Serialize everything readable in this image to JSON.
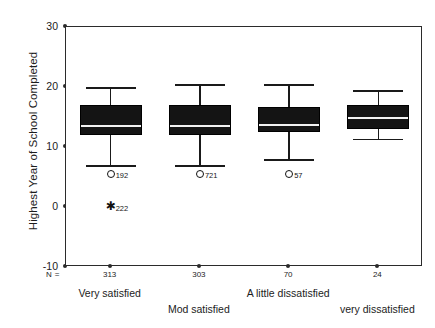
{
  "chart_data": {
    "type": "boxplot",
    "title": "",
    "xlabel": "",
    "ylabel": "Highest Year of School Completed",
    "ylim": [
      -10,
      30
    ],
    "yticks": [
      30,
      20,
      10,
      0,
      -10
    ],
    "grid": false,
    "legend": "none",
    "n_prefix": "N =",
    "categories": [
      "Very satisfied",
      "Mod satisfied",
      "A little dissatisfied",
      "very dissatisfied"
    ],
    "counts": [
      "313",
      "303",
      "70",
      "24"
    ],
    "boxes": [
      {
        "category": "Very satisfied",
        "n": "313",
        "whisker_low": 7.0,
        "q1": 12.0,
        "median": 13.6,
        "q3": 17.0,
        "whisker_high": 20.0,
        "outliers": [
          {
            "value": 5.5,
            "marker": "circle",
            "label": "192"
          },
          {
            "value": 0.0,
            "marker": "star",
            "label": "222"
          }
        ]
      },
      {
        "category": "Mod satisfied",
        "n": "303",
        "whisker_low": 7.0,
        "q1": 12.0,
        "median": 13.6,
        "q3": 17.0,
        "whisker_high": 20.5,
        "outliers": [
          {
            "value": 5.5,
            "marker": "circle",
            "label": "721"
          }
        ]
      },
      {
        "category": "A little dissatisfied",
        "n": "70",
        "whisker_low": 8.0,
        "q1": 12.5,
        "median": 13.8,
        "q3": 16.6,
        "whisker_high": 20.5,
        "outliers": [
          {
            "value": 5.5,
            "marker": "circle",
            "label": "57"
          }
        ]
      },
      {
        "category": "very dissatisfied",
        "n": "24",
        "whisker_low": 11.4,
        "q1": 13.0,
        "median": 15.0,
        "q3": 17.0,
        "whisker_high": 19.5,
        "outliers": []
      }
    ]
  },
  "colors": {
    "box_fill": "#141414",
    "axis": "#2b2b2b",
    "text": "#1c1c1c",
    "median": "#f2f2f2",
    "background": "#ffffff"
  }
}
